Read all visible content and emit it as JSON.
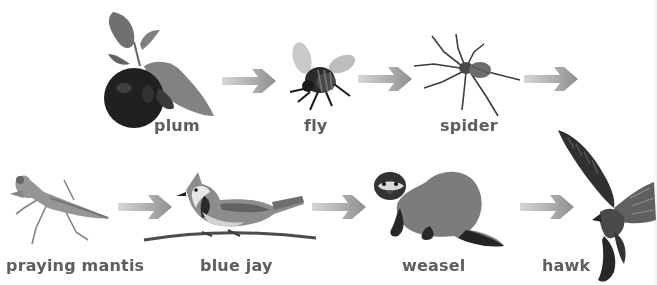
{
  "diagram": {
    "type": "food-chain",
    "nodes": [
      {
        "id": "plum",
        "label": "plum",
        "icon": "plum-icon"
      },
      {
        "id": "fly",
        "label": "fly",
        "icon": "fly-icon"
      },
      {
        "id": "spider",
        "label": "spider",
        "icon": "spider-icon"
      },
      {
        "id": "praying-mantis",
        "label": "praying mantis",
        "icon": "praying-mantis-icon"
      },
      {
        "id": "blue-jay",
        "label": "blue jay",
        "icon": "blue-jay-icon"
      },
      {
        "id": "weasel",
        "label": "weasel",
        "icon": "weasel-icon"
      },
      {
        "id": "hawk",
        "label": "hawk",
        "icon": "hawk-icon"
      }
    ],
    "edges": [
      {
        "from": "plum",
        "to": "fly"
      },
      {
        "from": "fly",
        "to": "spider"
      },
      {
        "from": "spider",
        "to": "praying-mantis"
      },
      {
        "from": "praying-mantis",
        "to": "blue-jay"
      },
      {
        "from": "blue-jay",
        "to": "weasel"
      },
      {
        "from": "weasel",
        "to": "hawk"
      }
    ],
    "colors": {
      "label": "#5e5e5e",
      "arrow": "#9a9a9a",
      "background": "#ffffff"
    }
  }
}
